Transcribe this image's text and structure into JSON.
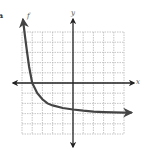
{
  "figure": {
    "problem_label": "a",
    "function_label": "f",
    "x_axis_label": "x",
    "y_axis_label": "y"
  },
  "colors": {
    "grid": "#b8b8b8",
    "axis": "#222222",
    "curve": "#444444",
    "label": "#555555"
  },
  "chart_data": {
    "type": "line",
    "title": "",
    "xlabel": "x",
    "ylabel": "y",
    "xlim": [
      -5,
      5
    ],
    "ylim": [
      -5,
      5
    ],
    "grid": true,
    "grid_step": 1,
    "legend": [],
    "annotations": [
      "f",
      "a"
    ],
    "series": [
      {
        "name": "f",
        "description": "decreasing exponential with horizontal asymptote near y = -3; arrows at both ends",
        "x": [
          -4.9,
          -4.7,
          -4.5,
          -4.3,
          -4.0,
          -3.5,
          -3.0,
          -2.5,
          -2.0,
          -1.0,
          0.0,
          1.0,
          2.0,
          3.0,
          4.0,
          5.0,
          5.7
        ],
        "y": [
          6.2,
          4.5,
          3.0,
          1.6,
          0.0,
          -1.0,
          -1.6,
          -2.0,
          -2.2,
          -2.45,
          -2.6,
          -2.72,
          -2.8,
          -2.85,
          -2.88,
          -2.9,
          -2.9
        ]
      }
    ],
    "asymptote": {
      "y": -3
    },
    "x_intercept": -4,
    "y_intercept": -2.6
  }
}
